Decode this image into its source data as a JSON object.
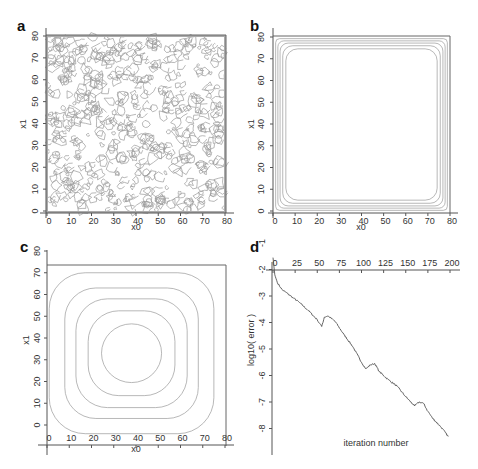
{
  "chart_data": [
    {
      "panel": "a",
      "type": "contour",
      "title": "",
      "xlabel": "x0",
      "ylabel": "x1",
      "xlim": [
        0,
        80
      ],
      "ylim": [
        0,
        80
      ],
      "x_ticks": [
        "0",
        "10",
        "20",
        "30",
        "40",
        "50",
        "60",
        "70",
        "80"
      ],
      "y_ticks": [
        "0",
        "10",
        "20",
        "30",
        "40",
        "50",
        "60",
        "70",
        "80"
      ],
      "description": "dense noisy random contour field filling entire square domain"
    },
    {
      "panel": "b",
      "type": "contour",
      "xlabel": "x0",
      "ylabel": "x1",
      "xlim": [
        0,
        80
      ],
      "ylim": [
        0,
        80
      ],
      "x_ticks": [
        "0",
        "10",
        "20",
        "30",
        "40",
        "50",
        "60",
        "70",
        "80"
      ],
      "y_ticks": [
        "0",
        "10",
        "20",
        "30",
        "40",
        "50",
        "60",
        "70",
        "80"
      ],
      "description": "nested rounded-square contours concentrated near boundary (approx 5 levels between 0 and ~6 units from edge), flat interior",
      "contour_insets": [
        1.2,
        2.2,
        3.2,
        4.4,
        5.8
      ]
    },
    {
      "panel": "c",
      "type": "contour",
      "xlabel": "x0",
      "ylabel": "x1",
      "xlim": [
        0,
        80
      ],
      "ylim": [
        0,
        80
      ],
      "x_ticks": [
        "0",
        "10",
        "20",
        "30",
        "40",
        "50",
        "60",
        "70",
        "80"
      ],
      "y_ticks": [
        "0",
        "10",
        "20",
        "30",
        "40",
        "50",
        "60",
        "70",
        "80"
      ],
      "description": "smooth nested rounded-square contours centered near (38, 33)",
      "contour_halfwidths": [
        37,
        30,
        25,
        19.5,
        13.5
      ],
      "center": [
        38,
        33
      ]
    },
    {
      "panel": "d",
      "type": "line",
      "xlabel": "iteration number",
      "ylabel": "log10( error )",
      "xlim": [
        0,
        200
      ],
      "ylim": [
        -8.5,
        -1
      ],
      "x_ticks": [
        "0",
        "25",
        "50",
        "75",
        "100",
        "125",
        "150",
        "175",
        "200"
      ],
      "y_ticks": [
        "-1",
        "-2",
        "-3",
        "-4",
        "-5",
        "-6",
        "-7",
        "-8"
      ],
      "series": [
        {
          "name": "log10 error",
          "x": [
            0,
            2,
            5,
            10,
            20,
            30,
            40,
            50,
            55,
            58,
            62,
            70,
            80,
            90,
            100,
            105,
            110,
            115,
            120,
            130,
            140,
            150,
            160,
            165,
            170,
            175,
            180,
            190,
            198
          ],
          "values": [
            -1.55,
            -2.2,
            -2.5,
            -2.75,
            -3.0,
            -3.25,
            -3.55,
            -3.9,
            -4.15,
            -3.8,
            -3.75,
            -3.95,
            -4.45,
            -4.9,
            -5.5,
            -5.75,
            -5.6,
            -5.55,
            -5.85,
            -6.15,
            -6.4,
            -6.8,
            -7.15,
            -7.0,
            -7.05,
            -7.35,
            -7.6,
            -7.95,
            -8.3
          ]
        }
      ]
    }
  ],
  "panels": {
    "a": {
      "letter": "a",
      "xlabel": "x0",
      "ylabel": "x1"
    },
    "b": {
      "letter": "b",
      "xlabel": "x0",
      "ylabel": "x1"
    },
    "c": {
      "letter": "c",
      "xlabel": "x0",
      "ylabel": "x1"
    },
    "d": {
      "letter": "d",
      "xlabel": "iteration number",
      "ylabel": "log10( error )"
    }
  },
  "ticks": {
    "xy80": [
      "0",
      "10",
      "20",
      "30",
      "40",
      "50",
      "60",
      "70",
      "80"
    ],
    "iter": [
      "0",
      "25",
      "50",
      "75",
      "100",
      "125",
      "150",
      "175",
      "200"
    ],
    "logerr": [
      "-1",
      "-2",
      "-3",
      "-4",
      "-5",
      "-6",
      "-7",
      "-8"
    ]
  }
}
